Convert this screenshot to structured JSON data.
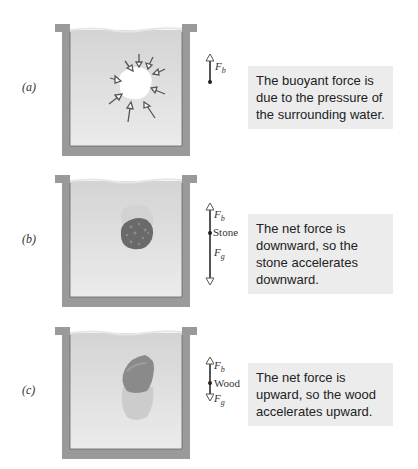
{
  "panels": [
    {
      "id": "a",
      "label": "(a)",
      "object": "displaced water region",
      "forces": {
        "buoyant": "F",
        "buoyant_sub": "b"
      },
      "caption": "The buoyant force is due to the pressure of the surrounding water."
    },
    {
      "id": "b",
      "label": "(b)",
      "object_label": "Stone",
      "forces": {
        "buoyant": "F",
        "buoyant_sub": "b",
        "gravity": "F",
        "gravity_sub": "g"
      },
      "caption": "The net force is downward, so the stone accelerates downward."
    },
    {
      "id": "c",
      "label": "(c)",
      "object_label": "Wood",
      "forces": {
        "buoyant": "F",
        "buoyant_sub": "b",
        "gravity": "F",
        "gravity_sub": "g"
      },
      "caption": "The net force is upward, so the wood accelerates upward."
    }
  ],
  "colors": {
    "tank_wall": "#9a9a9a",
    "water": "#d9d9d9",
    "caption_bg": "#ececec",
    "arrow": "#555555",
    "stone": "#6a6a6a",
    "wood": "#8a8a8a"
  }
}
